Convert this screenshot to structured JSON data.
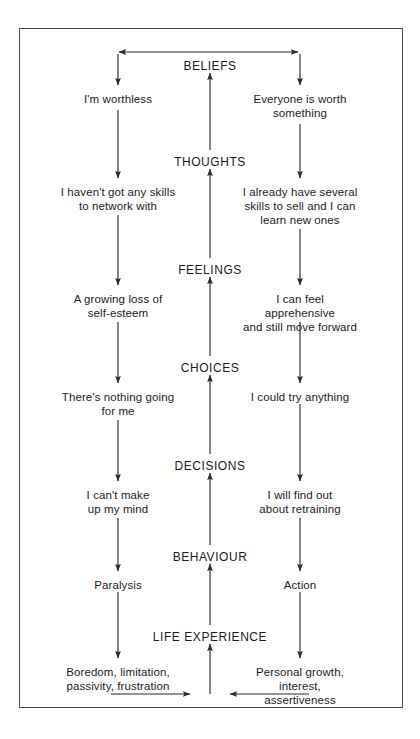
{
  "diagram": {
    "frame": {
      "border_color": "#4a4a4a"
    },
    "text_color": "#1c1c1c",
    "stage_labels": [
      {
        "id": "beliefs",
        "label": "BELIEFS",
        "x": 210,
        "y": 59
      },
      {
        "id": "thoughts",
        "label": "THOUGHTS",
        "x": 210,
        "y": 155
      },
      {
        "id": "feelings",
        "label": "FEELINGS",
        "x": 210,
        "y": 263
      },
      {
        "id": "choices",
        "label": "CHOICES",
        "x": 210,
        "y": 361
      },
      {
        "id": "decisions",
        "label": "DECISIONS",
        "x": 210,
        "y": 459
      },
      {
        "id": "behaviour",
        "label": "BEHAVIOUR",
        "x": 210,
        "y": 550
      },
      {
        "id": "life-experience",
        "label": "LIFE EXPERIENCE",
        "x": 210,
        "y": 630
      }
    ],
    "left_column": [
      {
        "id": "left-beliefs",
        "label": "I'm worthless",
        "x": 118,
        "y": 92
      },
      {
        "id": "left-thoughts",
        "label": "I haven't got any skills\nto network with",
        "x": 118,
        "y": 185
      },
      {
        "id": "left-feelings",
        "label": "A growing loss of\nself-esteem",
        "x": 118,
        "y": 292
      },
      {
        "id": "left-choices",
        "label": "There's nothing going\nfor me",
        "x": 118,
        "y": 390
      },
      {
        "id": "left-decisions",
        "label": "I can't make\nup my mind",
        "x": 118,
        "y": 488
      },
      {
        "id": "left-behaviour",
        "label": "Paralysis",
        "x": 118,
        "y": 578
      },
      {
        "id": "left-life-experience",
        "label": "Boredom, limitation,\npassivity, frustration",
        "x": 118,
        "y": 665
      }
    ],
    "right_column": [
      {
        "id": "right-beliefs",
        "label": "Everyone is worth\nsomething",
        "x": 300,
        "y": 92
      },
      {
        "id": "right-thoughts",
        "label": "I already have several\nskills to sell and I can\nlearn new ones",
        "x": 300,
        "y": 185
      },
      {
        "id": "right-feelings",
        "label": "I can feel apprehensive\nand still move forward",
        "x": 300,
        "y": 292
      },
      {
        "id": "right-choices",
        "label": "I could try anything",
        "x": 300,
        "y": 390
      },
      {
        "id": "right-decisions",
        "label": "I will find out\nabout retraining",
        "x": 300,
        "y": 488
      },
      {
        "id": "right-behaviour",
        "label": "Action",
        "x": 300,
        "y": 578
      },
      {
        "id": "right-life-experience",
        "label": "Personal growth, interest,\nassertiveness",
        "x": 300,
        "y": 665
      }
    ]
  }
}
